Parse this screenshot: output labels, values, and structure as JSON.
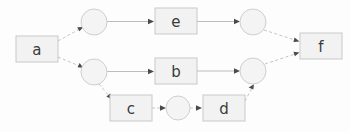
{
  "diagram": {
    "background_color": "#fdfdfd",
    "box_fill_color": "#f2f2f2",
    "box_stroke_color": "#c9c9c9",
    "circle_fill_color": "#f4f4f4",
    "circle_stroke_color": "#cfcfcf",
    "edge_color": "#bdbdbd",
    "arrow_color": "#4a4a4a",
    "label_color": "#3b3b3b",
    "nodes": [
      {
        "id": "a",
        "label": "a",
        "shape": "rect",
        "x": 16,
        "y": 36,
        "w": 42,
        "h": 26
      },
      {
        "id": "n1",
        "label": "",
        "shape": "circle",
        "cx": 94,
        "cy": 22,
        "r": 13
      },
      {
        "id": "n2",
        "label": "",
        "shape": "circle",
        "cx": 94,
        "cy": 72,
        "r": 13
      },
      {
        "id": "e",
        "label": "e",
        "shape": "rect",
        "x": 155,
        "y": 8,
        "w": 42,
        "h": 26
      },
      {
        "id": "b",
        "label": "b",
        "shape": "rect",
        "x": 155,
        "y": 58,
        "w": 42,
        "h": 26
      },
      {
        "id": "c",
        "label": "c",
        "shape": "rect",
        "x": 110,
        "y": 95,
        "w": 42,
        "h": 26
      },
      {
        "id": "n3",
        "label": "",
        "shape": "circle",
        "cx": 178,
        "cy": 108,
        "r": 12
      },
      {
        "id": "d",
        "label": "d",
        "shape": "rect",
        "x": 203,
        "y": 95,
        "w": 42,
        "h": 26
      },
      {
        "id": "n4",
        "label": "",
        "shape": "circle",
        "cx": 253,
        "cy": 22,
        "r": 13
      },
      {
        "id": "n5",
        "label": "",
        "shape": "circle",
        "cx": 253,
        "cy": 71,
        "r": 13
      },
      {
        "id": "f",
        "label": "f",
        "shape": "rect",
        "x": 300,
        "y": 33,
        "w": 42,
        "h": 26
      }
    ],
    "edges": [
      {
        "from": "a",
        "to": "n1",
        "style": "dashed",
        "x1": 58,
        "y1": 40,
        "x2": 82,
        "y2": 27
      },
      {
        "from": "a",
        "to": "n2",
        "style": "dashed",
        "x1": 58,
        "y1": 58,
        "x2": 82,
        "y2": 68
      },
      {
        "from": "n1",
        "to": "e",
        "style": "solid",
        "x1": 107,
        "y1": 21,
        "x2": 153,
        "y2": 21
      },
      {
        "from": "e",
        "to": "n4",
        "style": "solid",
        "x1": 197,
        "y1": 21,
        "x2": 239,
        "y2": 21
      },
      {
        "from": "n2",
        "to": "b",
        "style": "solid",
        "x1": 107,
        "y1": 71,
        "x2": 153,
        "y2": 71
      },
      {
        "from": "b",
        "to": "n5",
        "style": "solid",
        "x1": 197,
        "y1": 71,
        "x2": 239,
        "y2": 71
      },
      {
        "from": "n2",
        "to": "c",
        "style": "dashed",
        "x1": 100,
        "y1": 84,
        "x2": 112,
        "y2": 99
      },
      {
        "from": "c",
        "to": "n3",
        "style": "dashed",
        "x1": 152,
        "y1": 108,
        "x2": 165,
        "y2": 108
      },
      {
        "from": "n3",
        "to": "d",
        "style": "dashed",
        "x1": 190,
        "y1": 108,
        "x2": 201,
        "y2": 108
      },
      {
        "from": "d",
        "to": "n5",
        "style": "dashed",
        "x1": 245,
        "y1": 100,
        "x2": 254,
        "y2": 85
      },
      {
        "from": "n4",
        "to": "f",
        "style": "dashed",
        "x1": 264,
        "y1": 30,
        "x2": 299,
        "y2": 41
      },
      {
        "from": "n5",
        "to": "f",
        "style": "dashed",
        "x1": 265,
        "y1": 64,
        "x2": 299,
        "y2": 53
      }
    ]
  }
}
